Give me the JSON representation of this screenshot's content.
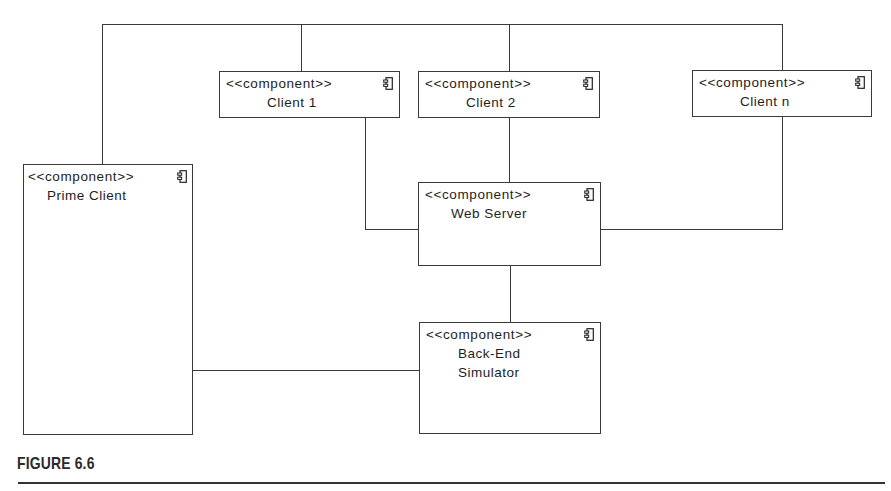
{
  "diagram": {
    "type": "uml-component-diagram",
    "stereotype": "<<component>>",
    "component_icon": "uml-component-icon",
    "components": [
      {
        "id": "client1",
        "name": "Client 1"
      },
      {
        "id": "client2",
        "name": "Client 2"
      },
      {
        "id": "clientn",
        "name": "Client n"
      },
      {
        "id": "prime",
        "name": "Prime Client"
      },
      {
        "id": "webserver",
        "name": "Web Server"
      },
      {
        "id": "backend",
        "name": "Back-End\nSimulator"
      }
    ],
    "connections": [
      {
        "from": "Prime Client",
        "to": "Client 1",
        "via": "top bus"
      },
      {
        "from": "Prime Client",
        "to": "Client 2",
        "via": "top bus"
      },
      {
        "from": "Prime Client",
        "to": "Client n",
        "via": "top bus"
      },
      {
        "from": "Client 1",
        "to": "Web Server"
      },
      {
        "from": "Client 2",
        "to": "Web Server"
      },
      {
        "from": "Client n",
        "to": "Web Server"
      },
      {
        "from": "Web Server",
        "to": "Back-End Simulator"
      },
      {
        "from": "Prime Client",
        "to": "Back-End Simulator"
      }
    ],
    "line_color": "#3a3a3a"
  },
  "caption": {
    "label": "FIGURE 6.6"
  }
}
